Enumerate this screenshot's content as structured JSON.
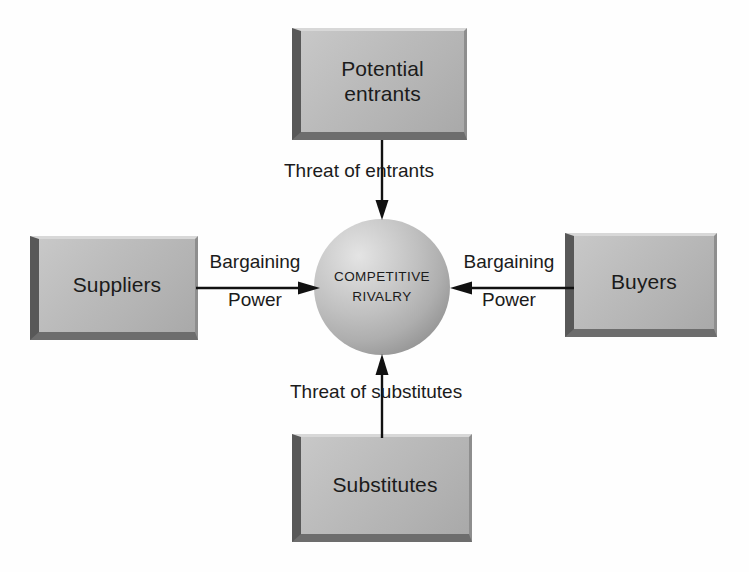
{
  "diagram": {
    "type": "porters-five-forces",
    "background_color": "#fefefe",
    "text_color": "#1b1b1b",
    "box_fill_color": "#bcbcbc",
    "box_shadow_color": "#585858",
    "sphere_highlight_color": "#e4e4e4",
    "sphere_shade_color": "#6a6a6a"
  },
  "center": {
    "name": "competitive-rivalry",
    "line1": "COMPETITIVE",
    "line2": "RIVALRY"
  },
  "forces": {
    "top": {
      "name": "potential-entrants",
      "label": "Potential\nentrants"
    },
    "left": {
      "name": "suppliers",
      "label": "Suppliers"
    },
    "right": {
      "name": "buyers",
      "label": "Buyers"
    },
    "bottom": {
      "name": "substitutes",
      "label": "Substitutes"
    }
  },
  "arrows": {
    "top": {
      "label": "Threat of entrants",
      "direction": "down",
      "from": "potential-entrants",
      "to": "competitive-rivalry"
    },
    "bottom": {
      "label": "Threat of substitutes",
      "direction": "up",
      "from": "substitutes",
      "to": "competitive-rivalry"
    },
    "left": {
      "label_top": "Bargaining",
      "label_bottom": "Power",
      "direction": "right",
      "from": "suppliers",
      "to": "competitive-rivalry"
    },
    "right": {
      "label_top": "Bargaining",
      "label_bottom": "Power",
      "direction": "left",
      "from": "buyers",
      "to": "competitive-rivalry"
    }
  }
}
